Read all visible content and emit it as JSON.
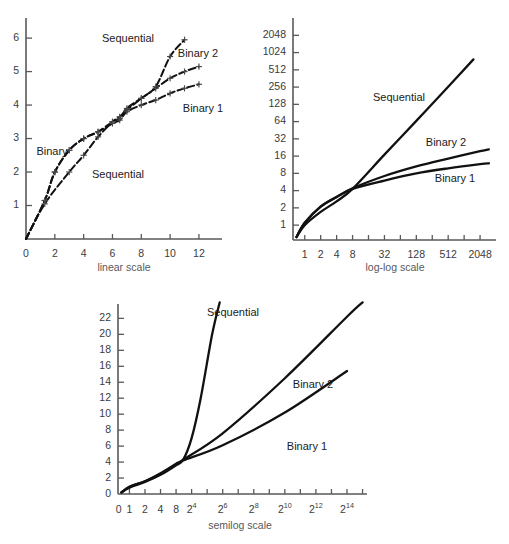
{
  "figure": {
    "panels": [
      {
        "id": "linear",
        "axis_title": "linear scale",
        "x_ticks": [
          "0",
          "2",
          "4",
          "6",
          "8",
          "10",
          "12"
        ],
        "y_ticks": [
          "1",
          "2",
          "3",
          "4",
          "5",
          "6"
        ],
        "series_labels": {
          "sequential_upper": "Sequential",
          "sequential_lower": "Sequential",
          "binary": "Binary",
          "binary1": "Binary 1",
          "binary2": "Binary 2"
        }
      },
      {
        "id": "loglog",
        "axis_title": "log-log scale",
        "x_ticks": [
          "1",
          "2",
          "4",
          "8",
          "32",
          "128",
          "512",
          "2048"
        ],
        "y_ticks": [
          "1",
          "2",
          "4",
          "8",
          "16",
          "32",
          "64",
          "128",
          "256",
          "512",
          "1024",
          "2048"
        ],
        "series_labels": {
          "sequential": "Sequential",
          "binary1": "Binary 1",
          "binary2": "Binary 2"
        }
      },
      {
        "id": "semilog",
        "axis_title": "semilog scale",
        "x_ticks": [
          "0",
          "1",
          "2",
          "4",
          "8",
          "2",
          "2",
          "2",
          "2",
          "2",
          "2"
        ],
        "x_tick_exponents": [
          "",
          "",
          "",
          "",
          "",
          "4",
          "6",
          "8",
          "10",
          "12",
          "14"
        ],
        "y_ticks": [
          "0",
          "2",
          "4",
          "6",
          "8",
          "10",
          "12",
          "14",
          "16",
          "18",
          "20",
          "22"
        ],
        "series_labels": {
          "sequential": "Sequential",
          "binary1": "Binary 1",
          "binary2": "Binary 2"
        }
      }
    ],
    "colors": {
      "curve": "#111111",
      "axis": "#58595b",
      "tick_label": "#3b3b3d",
      "axis_title": "#58595b",
      "marker": "#4a4a4c",
      "background": "#ffffff"
    }
  },
  "chart_data": [
    {
      "type": "line",
      "id": "linear",
      "title": "",
      "xlabel": "linear scale",
      "ylabel": "",
      "xlim": [
        0,
        13.6
      ],
      "ylim": [
        0,
        6.6
      ],
      "grid": false,
      "legend_position": "inline-annotations",
      "x_tick_values": [
        0,
        2,
        4,
        6,
        8,
        10,
        12
      ],
      "y_tick_values": [
        1,
        2,
        3,
        4,
        5,
        6
      ],
      "note": "x is list size n on a linear axis; y is average number of comparisons",
      "series": [
        {
          "name": "Sequential",
          "style": "dashed-with-plus-markers",
          "x": [
            0,
            1.3,
            3,
            4,
            5,
            6,
            6.5,
            7,
            8,
            9,
            10,
            11
          ],
          "y": [
            0,
            1.05,
            2.0,
            2.5,
            3.05,
            3.5,
            3.65,
            3.85,
            4.2,
            4.55,
            5.45,
            5.95
          ]
        },
        {
          "name": "Binary 2",
          "style": "dashed-with-plus-markers",
          "x": [
            0,
            1.3,
            2,
            3,
            4,
            5,
            6,
            6.5,
            7,
            8,
            9,
            10,
            11,
            12
          ],
          "y": [
            0,
            1.15,
            2.0,
            2.65,
            3.0,
            3.2,
            3.5,
            3.6,
            3.9,
            4.2,
            4.5,
            4.8,
            5.0,
            5.15
          ]
        },
        {
          "name": "Binary 1",
          "style": "dashed-with-plus-markers",
          "x": [
            0,
            1.3,
            2,
            3,
            4,
            5,
            6,
            6.5,
            7,
            8,
            9,
            10,
            11,
            12
          ],
          "y": [
            0,
            1.15,
            2.0,
            2.65,
            3.0,
            3.2,
            3.45,
            3.55,
            3.8,
            4.0,
            4.15,
            4.35,
            4.5,
            4.62
          ]
        }
      ]
    },
    {
      "type": "line",
      "id": "loglog",
      "title": "",
      "xlabel": "log-log scale",
      "ylabel": "",
      "xscale": "log2",
      "yscale": "log2",
      "xlim": [
        0.6,
        4096
      ],
      "ylim": [
        0.55,
        3500
      ],
      "grid": false,
      "legend_position": "inline-annotations",
      "x_tick_values": [
        1,
        2,
        4,
        8,
        16,
        32,
        64,
        128,
        256,
        512,
        1024,
        2048
      ],
      "x_tick_labels": [
        "1",
        "2",
        "4",
        "8",
        "",
        "32",
        "",
        "128",
        "",
        "512",
        "",
        "2048"
      ],
      "y_tick_values": [
        1,
        2,
        4,
        8,
        16,
        32,
        64,
        128,
        256,
        512,
        1024,
        2048
      ],
      "series": [
        {
          "name": "Sequential",
          "style": "solid",
          "x": [
            0.7,
            1,
            2,
            4,
            8,
            32,
            128,
            512,
            1536
          ],
          "y": [
            0.62,
            1.0,
            1.7,
            2.6,
            4.3,
            17,
            66,
            260,
            780
          ]
        },
        {
          "name": "Binary 2",
          "style": "solid",
          "x": [
            0.7,
            1,
            2,
            4,
            8,
            32,
            128,
            512,
            2048,
            3000
          ],
          "y": [
            0.62,
            1.1,
            2.1,
            3.1,
            4.4,
            7.2,
            10.6,
            14.5,
            19.5,
            21
          ]
        },
        {
          "name": "Binary 1",
          "style": "solid",
          "x": [
            0.7,
            1,
            2,
            4,
            8,
            32,
            128,
            512,
            2048,
            3000
          ],
          "y": [
            0.62,
            1.1,
            2.1,
            3.1,
            4.3,
            6.0,
            8.0,
            9.8,
            11.6,
            12
          ]
        }
      ]
    },
    {
      "type": "line",
      "id": "semilog",
      "title": "",
      "xlabel": "semilog scale",
      "ylabel": "",
      "xscale": "log2",
      "yscale": "linear",
      "xlim": [
        0.6,
        40000
      ],
      "ylim": [
        0,
        23.8
      ],
      "grid": false,
      "legend_position": "inline-annotations",
      "x_tick_values": [
        1,
        2,
        4,
        8,
        16,
        64,
        256,
        1024,
        4096,
        16384
      ],
      "x_tick_labels": [
        "1",
        "2",
        "4",
        "8",
        "2^4",
        "2^6",
        "2^8",
        "2^10",
        "2^12",
        "2^14"
      ],
      "y_tick_values": [
        0,
        2,
        4,
        6,
        8,
        10,
        12,
        14,
        16,
        18,
        20,
        22
      ],
      "series": [
        {
          "name": "Sequential",
          "style": "solid",
          "x": [
            0.7,
            1,
            2,
            4,
            8,
            11,
            16,
            24,
            40,
            56
          ],
          "y": [
            0.2,
            0.8,
            1.5,
            2.4,
            3.6,
            4.3,
            7.0,
            12.0,
            20.0,
            24.0
          ]
        },
        {
          "name": "Binary 2",
          "style": "solid",
          "x": [
            0.7,
            1,
            2,
            4,
            8,
            11,
            64,
            1024,
            16384,
            32768
          ],
          "y": [
            0.2,
            0.9,
            1.6,
            2.6,
            3.8,
            4.3,
            7.6,
            14.5,
            22.2,
            24.0
          ]
        },
        {
          "name": "Binary 1",
          "style": "solid",
          "x": [
            0.7,
            1,
            2,
            4,
            8,
            11,
            64,
            1024,
            16384
          ],
          "y": [
            0.2,
            0.9,
            1.6,
            2.5,
            3.7,
            4.2,
            6.1,
            10.2,
            15.4
          ]
        }
      ]
    }
  ]
}
